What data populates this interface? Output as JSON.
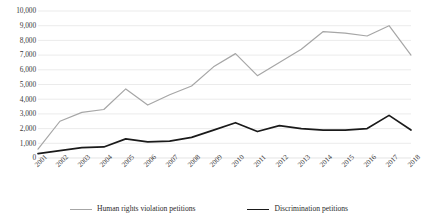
{
  "chart_data": {
    "type": "line",
    "title": "",
    "subtitle": "",
    "xlabel": "",
    "ylabel": "",
    "ylim": [
      0,
      10000
    ],
    "ytick_step": 1000,
    "grid": true,
    "legend_position": "bottom",
    "categories": [
      "2001",
      "2002",
      "2003",
      "2004",
      "2005",
      "2006",
      "2007",
      "2008",
      "2009",
      "2010",
      "2011",
      "2012",
      "2013",
      "2014",
      "2015",
      "2016",
      "2017",
      "2018"
    ],
    "ytick_labels": [
      "10,000",
      "9,000",
      "8,000",
      "7,000",
      "6,000",
      "5,000",
      "4,000",
      "3,000",
      "2,000",
      "1,000",
      "0"
    ],
    "ytick_values": [
      10000,
      9000,
      8000,
      7000,
      6000,
      5000,
      4000,
      3000,
      2000,
      1000,
      0
    ],
    "series": [
      {
        "name": "Human rights violation petitions",
        "color": "#a6a6a6",
        "stroke_width": 1.2,
        "values": [
          600,
          2500,
          3100,
          3300,
          4700,
          3600,
          4300,
          4900,
          6200,
          7100,
          5600,
          6500,
          7400,
          8600,
          8500,
          8300,
          9000,
          7000
        ]
      },
      {
        "name": "Discrimination petitions",
        "color": "#1a1a1a",
        "stroke_width": 1.7,
        "values": [
          300,
          500,
          700,
          750,
          1300,
          1100,
          1150,
          1400,
          1900,
          2400,
          1800,
          2200,
          2000,
          1900,
          1900,
          2000,
          2900,
          1900
        ]
      }
    ]
  },
  "legend": {
    "items": [
      {
        "label": "Human rights violation petitions",
        "color": "#a6a6a6",
        "width": 1.2
      },
      {
        "label": "Discrimination petitions",
        "color": "#1a1a1a",
        "width": 1.9
      }
    ]
  }
}
